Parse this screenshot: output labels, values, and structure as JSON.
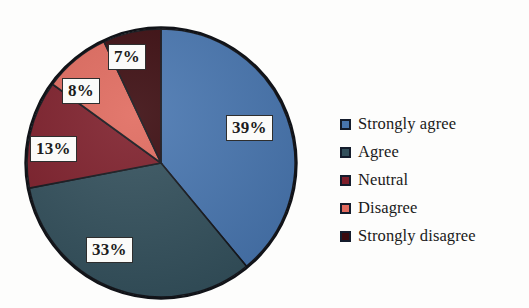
{
  "chart_data": {
    "type": "pie",
    "title": "",
    "subtitle": "",
    "xlabel": "",
    "ylabel": "",
    "legend_position": "right",
    "grid": false,
    "start_angle_deg": 0,
    "direction": "clockwise",
    "categories": [
      "Strongly agree",
      "Agree",
      "Neutral",
      "Disagree",
      "Strongly disagree"
    ],
    "values": [
      39,
      33,
      13,
      8,
      7
    ],
    "value_unit": "%",
    "data_labels": [
      "39%",
      "33%",
      "13%",
      "8%",
      "7%"
    ],
    "colors": [
      "#4876b0",
      "#33505c",
      "#7e1f2b",
      "#e06a5e",
      "#3a0a0e"
    ],
    "slices": [
      {
        "label": "Strongly agree",
        "value": 39,
        "data_label": "39%",
        "color": "#4876b0",
        "start_deg": 0,
        "end_deg": 140.4
      },
      {
        "label": "Agree",
        "value": 33,
        "data_label": "33%",
        "color": "#33505c",
        "start_deg": 140.4,
        "end_deg": 259.2
      },
      {
        "label": "Neutral",
        "value": 13,
        "data_label": "13%",
        "color": "#7e1f2b",
        "start_deg": 259.2,
        "end_deg": 306.0
      },
      {
        "label": "Disagree",
        "value": 8,
        "data_label": "8%",
        "color": "#e06a5e",
        "start_deg": 306.0,
        "end_deg": 334.8
      },
      {
        "label": "Strongly disagree",
        "value": 7,
        "data_label": "7%",
        "color": "#3a0a0e",
        "start_deg": 334.8,
        "end_deg": 360.0
      }
    ]
  },
  "legend": {
    "items": [
      {
        "label": "Strongly agree",
        "color": "#4876b0"
      },
      {
        "label": "Agree",
        "color": "#33505c"
      },
      {
        "label": "Neutral",
        "color": "#7e1f2b"
      },
      {
        "label": "Disagree",
        "color": "#e06a5e"
      },
      {
        "label": "Strongly disagree",
        "color": "#3a0a0e"
      }
    ]
  },
  "labels": {
    "strongly_agree_pct": "39%",
    "agree_pct": "33%",
    "neutral_pct": "13%",
    "disagree_pct": "8%",
    "strongly_disagree_pct": "7%"
  }
}
